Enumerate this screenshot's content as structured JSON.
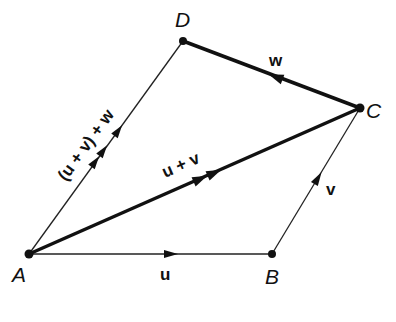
{
  "diagram": {
    "type": "vector-addition-polygon",
    "vertices": {
      "A": {
        "label": "A",
        "x": 29,
        "y": 254
      },
      "B": {
        "label": "B",
        "x": 272,
        "y": 254
      },
      "C": {
        "label": "C",
        "x": 360,
        "y": 108
      },
      "D": {
        "label": "D",
        "x": 183,
        "y": 41
      }
    },
    "vectors": {
      "u": {
        "label": "u",
        "from": "A",
        "to": "B"
      },
      "v": {
        "label": "v",
        "from": "B",
        "to": "C"
      },
      "w": {
        "label": "w",
        "from": "C",
        "to": "D"
      },
      "u_plus_v": {
        "label": "u + v",
        "from": "A",
        "to": "C"
      },
      "uv_plus_w": {
        "label": "(u + v) + w",
        "from": "A",
        "to": "D"
      }
    },
    "colors": {
      "ink": "#111111",
      "background": "#ffffff"
    }
  }
}
